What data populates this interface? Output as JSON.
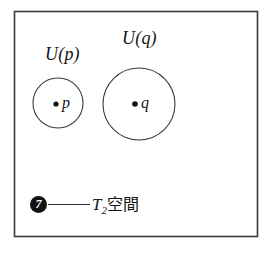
{
  "figure": {
    "kind": "mathematical-set-diagram",
    "background_color": "#ffffff",
    "ink_color": "#2a2a2a",
    "frame": {
      "name": "ambient-space-rectangle",
      "x": 14,
      "y": 11,
      "width": 244,
      "height": 226
    },
    "neighborhoods": [
      {
        "id": "up",
        "label": "U(p)",
        "label_x": 45,
        "label_y": 45,
        "circle_cx": 58,
        "circle_cy": 103,
        "circle_r": 25,
        "point_label": "p",
        "point_x": 56,
        "point_y": 104
      },
      {
        "id": "uq",
        "label": "U(q)",
        "label_x": 122,
        "label_y": 29,
        "circle_cx": 139,
        "circle_cy": 104,
        "circle_r": 36,
        "point_label": "q",
        "point_x": 135,
        "point_y": 104
      }
    ],
    "caption": {
      "badge_number": "7",
      "dash": "——",
      "symbol": "T",
      "subscript": "2",
      "term": "空間",
      "full_text": "T2空間"
    }
  }
}
